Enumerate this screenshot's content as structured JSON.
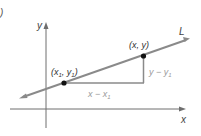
{
  "diagram": {
    "panel_marker": ")",
    "axes": {
      "x_label": "x",
      "y_label": "y"
    },
    "line_label": "L",
    "point1": {
      "label_open": "(x",
      "sub1": "1",
      "label_mid": ", y",
      "sub2": "1",
      "label_close": ")"
    },
    "point2": {
      "label": "(x, y)"
    },
    "run_label": {
      "main": "x − x",
      "sub": "1"
    },
    "rise_label": {
      "main": "y − y",
      "sub": "1"
    },
    "colors": {
      "line": "#8a8a8a",
      "axis": "#6e6e6e",
      "text": "#333333",
      "muted_text": "#9a9a9a",
      "point": "#111111"
    }
  }
}
